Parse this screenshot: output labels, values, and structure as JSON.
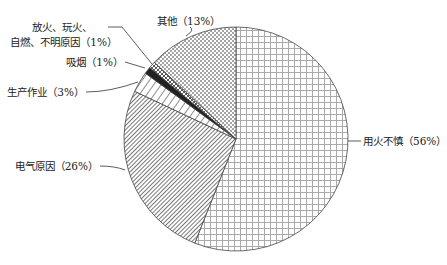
{
  "chart_data": {
    "type": "pie",
    "title": "",
    "start_angle_deg": 0,
    "direction": "clockwise",
    "slices": [
      {
        "label": "用火不慎",
        "value": 56,
        "display": "用火不慎（56%）",
        "pattern": "grid"
      },
      {
        "label": "电气原因",
        "value": 26,
        "display": "电气原因（26%）",
        "pattern": "diagonal-dense"
      },
      {
        "label": "生产作业",
        "value": 3,
        "display": "生产作业（3%）",
        "pattern": "diagonal-wide"
      },
      {
        "label": "吸烟",
        "value": 1,
        "display": "吸烟（1%）",
        "pattern": "solid-dark"
      },
      {
        "label": "放火、玩火、自燃、不明原因",
        "value": 1,
        "display_line1": "放火、玩火、",
        "display_line2": "自燃、不明原因（1%）",
        "pattern": "crosshatch"
      },
      {
        "label": "其他",
        "value": 13,
        "display": "其他（13%）",
        "pattern": "dots"
      }
    ]
  }
}
